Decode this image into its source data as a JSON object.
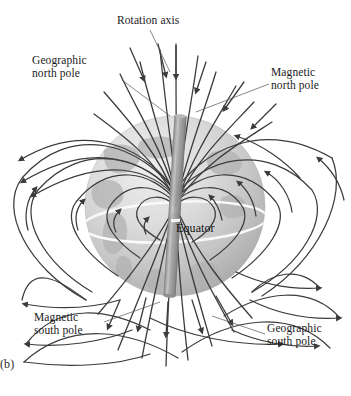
{
  "figure": {
    "panel_label": "(b)",
    "background_color": "#ffffff"
  },
  "labels": {
    "rotation_axis": "Rotation axis",
    "geographic_north_pole": "Geographic\nnorth pole",
    "magnetic_north_pole": "Magnetic\nnorth pole",
    "equator": "Equator",
    "magnetic_south_pole": "Magnetic\nsouth pole",
    "geographic_south_pole": "Geographic\nsouth pole"
  },
  "colors": {
    "field_line": "#3c3c3c",
    "earth_light": "#e8e8e8",
    "earth_mid": "#c9c9c9",
    "earth_dark": "#a8a8a8",
    "continent": "#b0b0b0",
    "equator_line": "#ffffff",
    "axis_band": "#9c9c9c",
    "label_text": "#1a1a1a",
    "leader_line": "#555555"
  },
  "geometry": {
    "earth_center_x": 175,
    "earth_center_y": 206,
    "earth_radius": 90,
    "axis_tilt_degrees": 4,
    "equator_label_position": "on-sphere-right-of-center"
  },
  "field_lines": {
    "description": "Dipole magnetic field loops emanating from the magnetic south pole region and converging at the magnetic north pole region",
    "arrow_direction": "into north pole, out of south pole",
    "loop_count_per_side": 6
  }
}
